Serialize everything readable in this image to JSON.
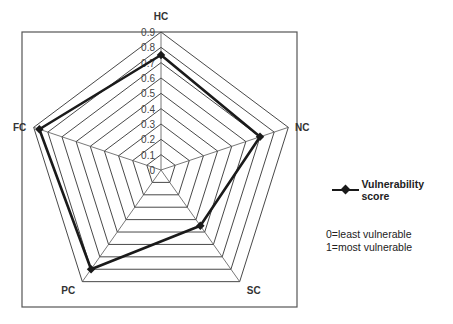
{
  "chart_data": {
    "type": "radar",
    "title": "",
    "categories": [
      "HC",
      "NC",
      "SC",
      "PC",
      "FC"
    ],
    "series": [
      {
        "name": "Vulnerability score",
        "values": [
          0.75,
          0.7,
          0.45,
          0.8,
          0.86
        ],
        "color": "#1a1a1a",
        "marker": "diamond"
      }
    ],
    "radial_ticks": [
      "0",
      "0.1",
      "0.2",
      "0.3",
      "0.4",
      "0.5",
      "0.6",
      "0.7",
      "0.8",
      "0.9"
    ],
    "rlim": [
      0,
      0.9
    ],
    "grid": true,
    "legend_position": "right"
  },
  "legend": {
    "series_label": "Vulnerability score"
  },
  "notes": {
    "line1": "0=least vulnerable",
    "line2": "1=most vulnerable"
  }
}
